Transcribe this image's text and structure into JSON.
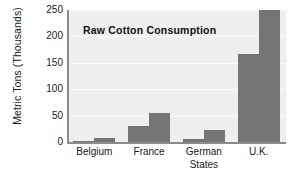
{
  "chart_data": {
    "type": "bar",
    "title": "Raw Cotton Consumption",
    "xlabel": "",
    "ylabel": "Metric Tons (Thousands)",
    "categories": [
      "Belgium",
      "France",
      "German\nStates",
      "U.K."
    ],
    "series": [
      {
        "name": "series-1",
        "values": [
          1,
          30,
          5,
          167
        ]
      },
      {
        "name": "series-2",
        "values": [
          8,
          55,
          22,
          260
        ]
      }
    ],
    "ylim": [
      0,
      250
    ],
    "yticks": [
      0,
      50,
      100,
      150,
      200,
      250
    ],
    "ytick_labels": [
      "0",
      "50",
      "100",
      "150",
      "200",
      "250"
    ],
    "grid": true,
    "legend": "none",
    "bar_color": "#757575",
    "plot_background": "#efefef",
    "gridline_color": "#fbfbfb",
    "axis_color": "#8a8a8a",
    "note": "Second U.K. bar exceeds the 250 axis maximum and is clipped at the top of the plot area."
  }
}
